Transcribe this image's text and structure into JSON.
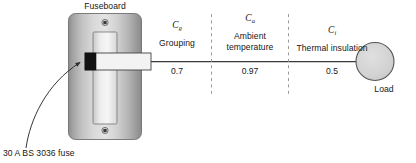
{
  "diagram": {
    "title_label": "Fuseboard",
    "fuse_annotation": "30 A BS 3036 fuse",
    "load_label": "Load",
    "colors": {
      "board_light": "#e6e6e6",
      "board_mid": "#b8b8b8",
      "board_dark": "#8f8f8f",
      "fuse_black": "#111111",
      "line": "#3a3a3a",
      "load_fill": "#d6d6d6",
      "dash": "#8a8a8a"
    },
    "factors": [
      {
        "symbol": "C",
        "subscript": "g",
        "name": "Grouping",
        "value": "0.7"
      },
      {
        "symbol": "C",
        "subscript": "a",
        "name": "Ambient temperature",
        "value": "0.97"
      },
      {
        "symbol": "C",
        "subscript": "i",
        "name": "Thermal insulation",
        "value": "0.5"
      }
    ]
  }
}
